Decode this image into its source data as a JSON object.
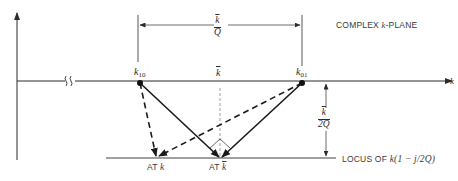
{
  "diagram": {
    "title": "COMPLEX k-PLANE",
    "title_parts": {
      "prefix": "COMPLEX ",
      "var": "k",
      "suffix": "-PLANE"
    },
    "axis_label": "k",
    "points": {
      "k10": {
        "base": "k",
        "sub": "10"
      },
      "k01": {
        "base": "k",
        "sub": "01"
      },
      "kbar": "k"
    },
    "dimension_top": {
      "numerator": "k",
      "denominator": "Q"
    },
    "dimension_right": {
      "numerator": "k",
      "denominator": "2Q"
    },
    "locus_label": {
      "prefix": "LOCUS OF ",
      "expr": "k(1 − j/2Q)"
    },
    "at_k_label": {
      "prefix": "AT ",
      "var": "k"
    },
    "at_kbar_label": {
      "prefix": "AT ",
      "var": "k"
    },
    "colors": {
      "ink": "#2b2b2b",
      "dashed_guide": "#8a8a8a",
      "background": "#ffffff"
    }
  }
}
